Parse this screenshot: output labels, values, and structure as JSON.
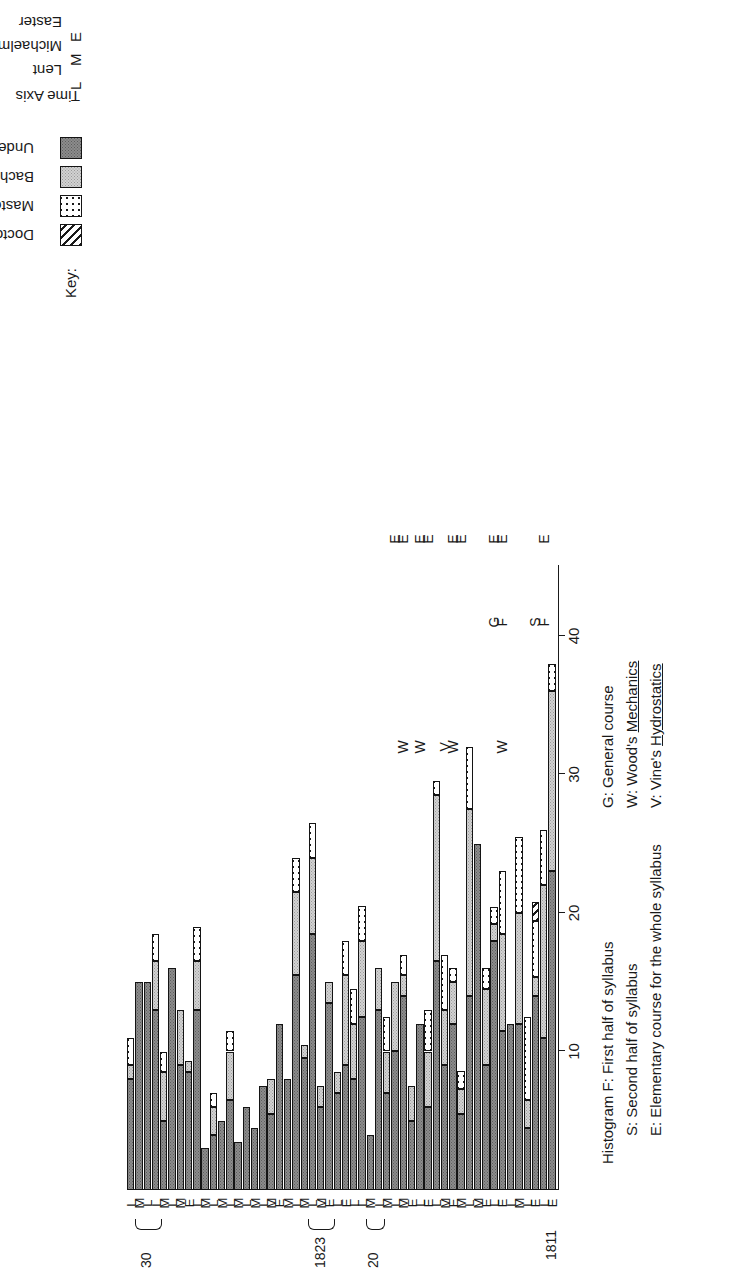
{
  "key": {
    "title": "Key:",
    "entries": [
      {
        "label": "Doctors",
        "pattern": "diagonal-hatch",
        "color": "#ffffff"
      },
      {
        "label": "Masters",
        "pattern": "coarse-dots",
        "color": "#ffffff"
      },
      {
        "label": "Bachelors",
        "pattern": "fine-dots-light",
        "color": "#d2d2d2"
      },
      {
        "label": "Undergraduates",
        "pattern": "fine-dots-dark",
        "color": "#8c8c8c"
      }
    ]
  },
  "time_axis_legend": {
    "title": "Time Axis",
    "entries": [
      {
        "code": "L",
        "label": "Lent"
      },
      {
        "code": "M",
        "label": "Michaelmas"
      },
      {
        "code": "E",
        "label": "Easter"
      }
    ]
  },
  "notes_left": [
    "Histogram F: First half of syllabus",
    "S: Second half of syllabus",
    "E: Elementary course for the whole syllabus"
  ],
  "notes_right": [
    {
      "text": "G: General course",
      "underline": ""
    },
    {
      "text": "W: Wood's ",
      "underline": "Mechanics"
    },
    {
      "text": "V: Vine's ",
      "underline": "Hydrostatics"
    }
  ],
  "start_year": "1811",
  "year_groups": [
    {
      "label": "20",
      "first_index": 21,
      "last_index": 22
    },
    {
      "label": "1823",
      "first_index": 27,
      "last_index": 29
    },
    {
      "label": "30",
      "first_index": 48,
      "last_index": 50
    }
  ],
  "annotations": [
    {
      "text": "F",
      "index": 1,
      "value": 41.0
    },
    {
      "text": "S",
      "index": 2,
      "value": 41.0
    },
    {
      "text": "F",
      "index": 6,
      "value": 41.0
    },
    {
      "text": "G",
      "index": 7,
      "value": 41.0
    },
    {
      "text": "W",
      "index": 6,
      "value": 32.0
    },
    {
      "text": "W",
      "index": 12,
      "value": 32.0
    },
    {
      "text": "V",
      "index": 13,
      "value": 32.0
    },
    {
      "text": "W",
      "index": 16,
      "value": 32.0
    },
    {
      "text": "W",
      "index": 18,
      "value": 32.0
    },
    {
      "text": "E",
      "index": 1,
      "value": 47.0
    },
    {
      "text": "E",
      "index": 6,
      "value": 47.0
    },
    {
      "text": "E",
      "index": 7,
      "value": 47.0
    },
    {
      "text": "E",
      "index": 11,
      "value": 47.0
    },
    {
      "text": "E",
      "index": 12,
      "value": 47.0
    },
    {
      "text": "E",
      "index": 15,
      "value": 47.0
    },
    {
      "text": "E",
      "index": 16,
      "value": 47.0
    },
    {
      "text": "E",
      "index": 18,
      "value": 47.0
    },
    {
      "text": "E",
      "index": 19,
      "value": 47.0
    }
  ],
  "chart_data": {
    "type": "bar",
    "orientation": "horizontal-stacked",
    "title": "",
    "xlabel": "",
    "ylabel": "",
    "ylim": [
      0,
      45
    ],
    "grid": false,
    "legend_position": "top-right",
    "tick_values": [
      0,
      10,
      20,
      30,
      40
    ],
    "tick_labels": [
      "",
      "10",
      "20",
      "30",
      "40"
    ],
    "series": [
      {
        "name": "Undergraduates",
        "key": "undergraduates"
      },
      {
        "name": "Bachelors",
        "key": "bachelors"
      },
      {
        "name": "Masters",
        "key": "masters"
      },
      {
        "name": "Doctors",
        "key": "doctors"
      }
    ],
    "categories": [
      "E",
      "L",
      "E",
      "L",
      "M",
      "L",
      "E",
      "L",
      "E",
      "M",
      "L",
      "M",
      "E",
      "M",
      "L",
      "E",
      "L",
      "E",
      "M",
      "L",
      "M",
      "L",
      "M",
      "L",
      "L",
      "E",
      "L",
      "E",
      "M",
      "L",
      "M",
      "L",
      "M",
      "E",
      "M",
      "L",
      "M",
      "L",
      "M",
      "L",
      "M",
      "L",
      "M",
      "L",
      "E",
      "M",
      "L",
      "M",
      "L",
      "L",
      "M",
      "L"
    ],
    "bars": [
      {
        "index": 0,
        "term": "E",
        "undergraduates": 23.0,
        "bachelors": 13.0,
        "masters": 2.0,
        "doctors": 0
      },
      {
        "index": 1,
        "term": "L",
        "undergraduates": 11.0,
        "bachelors": 11.0,
        "masters": 4.0,
        "doctors": 0
      },
      {
        "index": 2,
        "term": "E",
        "undergraduates": 14.0,
        "bachelors": 1.4,
        "masters": 4.0,
        "doctors": 1.4
      },
      {
        "index": 3,
        "term": "L",
        "undergraduates": 4.5,
        "bachelors": 2.0,
        "masters": 6.0,
        "doctors": 0
      },
      {
        "index": 4,
        "term": "M",
        "undergraduates": 12.0,
        "bachelors": 8.0,
        "masters": 5.5,
        "doctors": 0
      },
      {
        "index": 5,
        "term": "L",
        "undergraduates": 12.0,
        "bachelors": 0,
        "masters": 0,
        "doctors": 0
      },
      {
        "index": 6,
        "term": "E",
        "undergraduates": 11.5,
        "bachelors": 7.0,
        "masters": 4.5,
        "doctors": 0
      },
      {
        "index": 7,
        "term": "L",
        "undergraduates": 18.0,
        "bachelors": 1.2,
        "masters": 1.2,
        "doctors": 0
      },
      {
        "index": 8,
        "term": "E",
        "undergraduates": 9.0,
        "bachelors": 5.5,
        "masters": 1.5,
        "doctors": 0
      },
      {
        "index": 9,
        "term": "M",
        "undergraduates": 25.0,
        "bachelors": 0,
        "masters": 0,
        "doctors": 0
      },
      {
        "index": 10,
        "term": "L",
        "undergraduates": 14.0,
        "bachelors": 13.5,
        "masters": 4.5,
        "doctors": 0
      },
      {
        "index": 11,
        "term": "M",
        "undergraduates": 5.5,
        "bachelors": 1.8,
        "masters": 1.3,
        "doctors": 0
      },
      {
        "index": 12,
        "term": "E",
        "undergraduates": 12.0,
        "bachelors": 3.0,
        "masters": 1.0,
        "doctors": 0
      },
      {
        "index": 13,
        "term": "M",
        "undergraduates": 9.0,
        "bachelors": 4.0,
        "masters": 4.0,
        "doctors": 0
      },
      {
        "index": 14,
        "term": "L",
        "undergraduates": 16.5,
        "bachelors": 12.0,
        "masters": 1.0,
        "doctors": 0
      },
      {
        "index": 15,
        "term": "E",
        "undergraduates": 6.0,
        "bachelors": 4.0,
        "masters": 3.0,
        "doctors": 0
      },
      {
        "index": 16,
        "term": "L",
        "undergraduates": 12.0,
        "bachelors": 0,
        "masters": 0,
        "doctors": 0
      },
      {
        "index": 17,
        "term": "E",
        "undergraduates": 5.0,
        "bachelors": 2.5,
        "masters": 0,
        "doctors": 0
      },
      {
        "index": 18,
        "term": "M",
        "undergraduates": 14.0,
        "bachelors": 1.5,
        "masters": 1.5,
        "doctors": 0
      },
      {
        "index": 19,
        "term": "L",
        "undergraduates": 10.0,
        "bachelors": 5.0,
        "masters": 0,
        "doctors": 0
      },
      {
        "index": 20,
        "term": "M",
        "undergraduates": 7.0,
        "bachelors": 3.0,
        "masters": 2.5,
        "doctors": 0
      },
      {
        "index": 21,
        "term": "L",
        "undergraduates": 13.0,
        "bachelors": 3.0,
        "masters": 0,
        "doctors": 0
      },
      {
        "index": 22,
        "term": "M",
        "undergraduates": 4.0,
        "bachelors": 0,
        "masters": 0,
        "doctors": 0
      },
      {
        "index": 23,
        "term": "L",
        "undergraduates": 12.5,
        "bachelors": 5.5,
        "masters": 2.5,
        "doctors": 0
      },
      {
        "index": 24,
        "term": "L",
        "undergraduates": 8.0,
        "bachelors": 4.0,
        "masters": 2.5,
        "doctors": 0
      },
      {
        "index": 25,
        "term": "E",
        "undergraduates": 9.0,
        "bachelors": 6.5,
        "masters": 2.5,
        "doctors": 0
      },
      {
        "index": 26,
        "term": "L",
        "undergraduates": 7.0,
        "bachelors": 1.5,
        "masters": 0,
        "doctors": 0
      },
      {
        "index": 27,
        "term": "E",
        "undergraduates": 13.5,
        "bachelors": 1.5,
        "masters": 0,
        "doctors": 0
      },
      {
        "index": 28,
        "term": "M",
        "undergraduates": 6.0,
        "bachelors": 1.5,
        "masters": 0,
        "doctors": 0
      },
      {
        "index": 29,
        "term": "L",
        "undergraduates": 18.5,
        "bachelors": 5.5,
        "masters": 2.5,
        "doctors": 0
      },
      {
        "index": 30,
        "term": "M",
        "undergraduates": 9.5,
        "bachelors": 1.0,
        "masters": 0,
        "doctors": 0
      },
      {
        "index": 31,
        "term": "L",
        "undergraduates": 15.5,
        "bachelors": 6.0,
        "masters": 2.5,
        "doctors": 0
      },
      {
        "index": 32,
        "term": "M",
        "undergraduates": 8.0,
        "bachelors": 0,
        "masters": 0,
        "doctors": 0
      },
      {
        "index": 33,
        "term": "E",
        "undergraduates": 12.0,
        "bachelors": 0,
        "masters": 0,
        "doctors": 0
      },
      {
        "index": 34,
        "term": "M",
        "undergraduates": 5.5,
        "bachelors": 2.5,
        "masters": 0,
        "doctors": 0
      },
      {
        "index": 35,
        "term": "L",
        "undergraduates": 7.5,
        "bachelors": 0,
        "masters": 0,
        "doctors": 0
      },
      {
        "index": 36,
        "term": "M",
        "undergraduates": 4.5,
        "bachelors": 0,
        "masters": 0,
        "doctors": 0
      },
      {
        "index": 37,
        "term": "L",
        "undergraduates": 6.0,
        "bachelors": 0,
        "masters": 0,
        "doctors": 0
      },
      {
        "index": 38,
        "term": "M",
        "undergraduates": 3.5,
        "bachelors": 0,
        "masters": 0,
        "doctors": 0
      },
      {
        "index": 39,
        "term": "L",
        "undergraduates": 6.5,
        "bachelors": 3.5,
        "masters": 1.5,
        "doctors": 0
      },
      {
        "index": 40,
        "term": "M",
        "undergraduates": 5.0,
        "bachelors": 0,
        "masters": 0,
        "doctors": 0
      },
      {
        "index": 41,
        "term": "L",
        "undergraduates": 4.0,
        "bachelors": 2.0,
        "masters": 1.0,
        "doctors": 0
      },
      {
        "index": 42,
        "term": "M",
        "undergraduates": 3.0,
        "bachelors": 0,
        "masters": 0,
        "doctors": 0
      },
      {
        "index": 43,
        "term": "L",
        "undergraduates": 13.0,
        "bachelors": 3.5,
        "masters": 2.5,
        "doctors": 0
      },
      {
        "index": 44,
        "term": "E",
        "undergraduates": 8.5,
        "bachelors": 0.8,
        "masters": 0,
        "doctors": 0
      },
      {
        "index": 45,
        "term": "M",
        "undergraduates": 9.0,
        "bachelors": 4.0,
        "masters": 0,
        "doctors": 0
      },
      {
        "index": 46,
        "term": "L",
        "undergraduates": 16.0,
        "bachelors": 0,
        "masters": 0,
        "doctors": 0
      },
      {
        "index": 47,
        "term": "M",
        "undergraduates": 5.0,
        "bachelors": 3.5,
        "masters": 1.5,
        "doctors": 0
      },
      {
        "index": 48,
        "term": "L",
        "undergraduates": 13.0,
        "bachelors": 3.5,
        "masters": 2.0,
        "doctors": 0
      },
      {
        "index": 49,
        "term": "L",
        "undergraduates": 15.0,
        "bachelors": 0,
        "masters": 0,
        "doctors": 0
      },
      {
        "index": 50,
        "term": "M",
        "undergraduates": 15.0,
        "bachelors": 0,
        "masters": 0,
        "doctors": 0
      },
      {
        "index": 51,
        "term": "L",
        "undergraduates": 8.0,
        "bachelors": 1.0,
        "masters": 2.0,
        "doctors": 0
      }
    ]
  }
}
